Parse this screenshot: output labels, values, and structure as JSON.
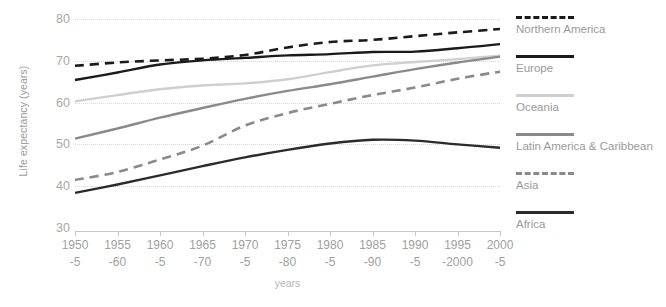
{
  "chart_data": {
    "type": "line",
    "title": "",
    "xlabel": "years",
    "ylabel": "Life expectancy (years)",
    "ylim": [
      30,
      80
    ],
    "yticks": [
      30,
      40,
      50,
      60,
      70,
      80
    ],
    "grid": true,
    "legend_position": "right",
    "categories": [
      "1950-5",
      "1955-60",
      "1960-5",
      "1965-70",
      "1970-5",
      "1975-80",
      "1980-5",
      "1985-90",
      "1990-5",
      "1995-2000",
      "2000-5"
    ],
    "category_lines": [
      [
        "1950",
        "-5"
      ],
      [
        "1955",
        "-60"
      ],
      [
        "1960",
        "-5"
      ],
      [
        "1965",
        "-70"
      ],
      [
        "1970",
        "-5"
      ],
      [
        "1975",
        "-80"
      ],
      [
        "1980",
        "-5"
      ],
      [
        "1985",
        "-90"
      ],
      [
        "1990",
        "-5"
      ],
      [
        "1995",
        "-2000"
      ],
      [
        "2000",
        "-5"
      ]
    ],
    "series": [
      {
        "name": "Northern America",
        "style": "dashed",
        "color": "#1a1a1a",
        "values": [
          68.8,
          69.6,
          70.1,
          70.5,
          71.4,
          73.2,
          74.5,
          75.0,
          75.9,
          76.8,
          77.6
        ]
      },
      {
        "name": "Europe",
        "style": "solid",
        "color": "#1a1a1a",
        "values": [
          65.4,
          67.2,
          69.1,
          70.1,
          70.7,
          71.3,
          71.6,
          72.1,
          72.2,
          73.0,
          74.0
        ]
      },
      {
        "name": "Oceania",
        "style": "solid",
        "color": "#cfcfcf",
        "values": [
          60.3,
          61.8,
          63.2,
          64.1,
          64.6,
          65.6,
          67.3,
          68.9,
          69.7,
          70.4,
          71.2
        ]
      },
      {
        "name": "Latin America & Caribbean",
        "style": "solid",
        "color": "#8a8a8a",
        "values": [
          51.4,
          53.8,
          56.4,
          58.7,
          60.9,
          62.8,
          64.4,
          66.2,
          68.0,
          69.6,
          71.0
        ]
      },
      {
        "name": "Asia",
        "style": "dashed",
        "color": "#8a8a8a",
        "values": [
          41.5,
          43.4,
          46.4,
          49.7,
          54.5,
          57.5,
          59.7,
          61.8,
          63.6,
          65.7,
          67.4
        ]
      },
      {
        "name": "Africa",
        "style": "solid",
        "color": "#2b2b2b",
        "values": [
          38.4,
          40.4,
          42.6,
          44.8,
          46.9,
          48.7,
          50.2,
          51.1,
          50.9,
          50.0,
          49.2
        ]
      }
    ]
  }
}
